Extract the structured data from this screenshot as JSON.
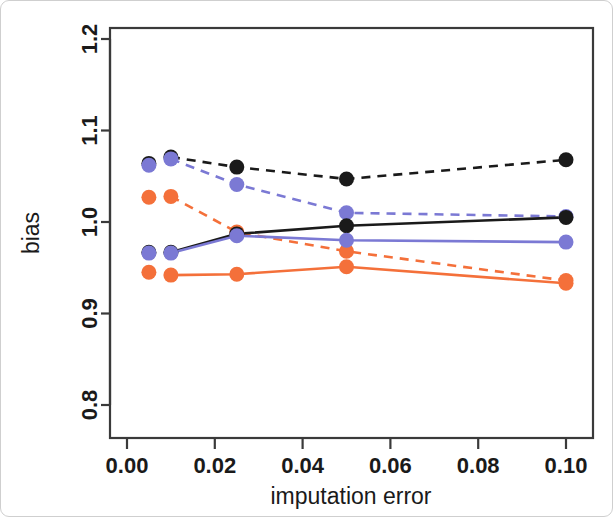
{
  "figure": {
    "background_color": "#ffffff",
    "frame_color": "#cfcfcf"
  },
  "chart_data": {
    "type": "line",
    "title": "",
    "xlabel": "imputation error",
    "ylabel": "bias",
    "xlim": [
      0.0,
      0.106
    ],
    "ylim": [
      0.78,
      1.215
    ],
    "xticks": [
      0.0,
      0.02,
      0.04,
      0.06,
      0.08,
      0.1
    ],
    "xtick_labels": [
      "0.00",
      "0.02",
      "0.04",
      "0.06",
      "0.08",
      "0.10"
    ],
    "yticks": [
      0.8,
      0.9,
      1.0,
      1.1,
      1.2
    ],
    "ytick_labels": [
      "0.8",
      "0.9",
      "1.0",
      "1.1",
      "1.2"
    ],
    "grid": false,
    "legend": "none",
    "x": [
      0.005,
      0.01,
      0.025,
      0.05,
      0.1
    ],
    "colors": {
      "black": "#1a1a1a",
      "blue": "#7b79d4",
      "orange": "#f4703a"
    },
    "series": [
      {
        "name": "black-dashed",
        "color": "#1a1a1a",
        "style": "dashed",
        "markers": true,
        "values": [
          1.064,
          1.071,
          1.06,
          1.047,
          1.068
        ]
      },
      {
        "name": "blue-dashed",
        "color": "#7b79d4",
        "style": "dashed",
        "markers": true,
        "values": [
          1.062,
          1.069,
          1.041,
          1.01,
          1.006
        ]
      },
      {
        "name": "orange-dashed",
        "color": "#f4703a",
        "style": "dashed",
        "markers": true,
        "values": [
          1.027,
          1.028,
          0.989,
          0.968,
          0.936
        ]
      },
      {
        "name": "black-solid",
        "color": "#1a1a1a",
        "style": "solid",
        "markers": true,
        "values": [
          0.967,
          0.967,
          0.987,
          0.996,
          1.005
        ]
      },
      {
        "name": "blue-solid",
        "color": "#7b79d4",
        "style": "solid",
        "markers": true,
        "values": [
          0.966,
          0.966,
          0.985,
          0.98,
          0.978
        ]
      },
      {
        "name": "orange-solid",
        "color": "#f4703a",
        "style": "solid",
        "markers": true,
        "values": [
          0.945,
          0.942,
          0.943,
          0.951,
          0.933
        ]
      }
    ]
  }
}
